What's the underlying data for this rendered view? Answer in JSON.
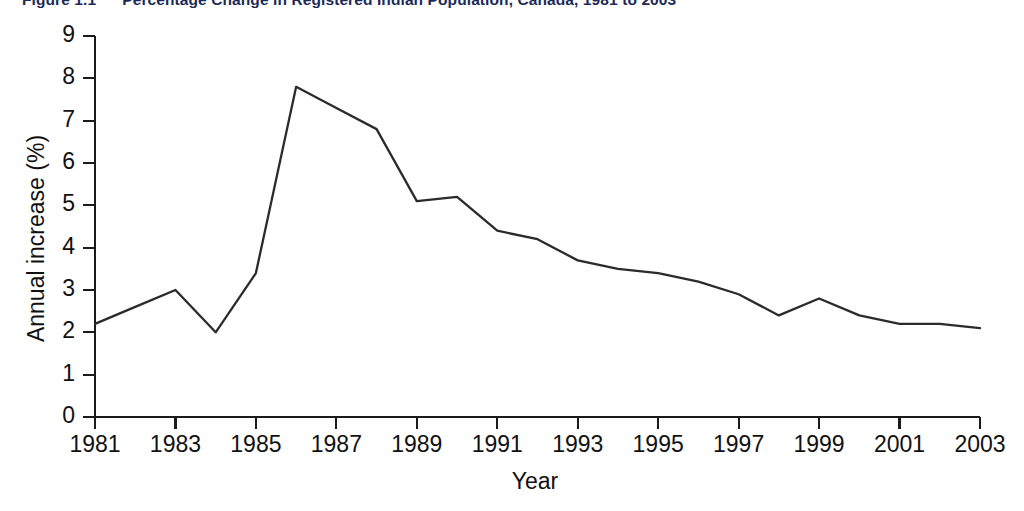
{
  "figure": {
    "title_number": "Figure 1.1",
    "title_text": "Percentage Change in Registered Indian Population, Canada, 1981 to 2003",
    "title_clipped": true
  },
  "chart_data": {
    "type": "line",
    "title": "Percentage Change in Registered Indian Population, Canada, 1981 to 2003",
    "xlabel": "Year",
    "ylabel": "Annual increase (%)",
    "xlim": [
      1981,
      2003
    ],
    "ylim": [
      0,
      9
    ],
    "grid": false,
    "legend": null,
    "line_color": "#2b2b2b",
    "x": [
      1981,
      1982,
      1983,
      1984,
      1985,
      1986,
      1987,
      1988,
      1989,
      1990,
      1991,
      1992,
      1993,
      1994,
      1995,
      1996,
      1997,
      1998,
      1999,
      2000,
      2001,
      2002,
      2003
    ],
    "values": [
      2.2,
      2.6,
      3.0,
      2.0,
      3.4,
      7.8,
      7.3,
      6.8,
      5.1,
      5.2,
      4.4,
      4.2,
      3.7,
      3.5,
      3.4,
      3.2,
      2.9,
      2.4,
      2.8,
      2.4,
      2.2,
      2.2,
      2.1
    ],
    "ytick_labels": [
      "0",
      "1",
      "2",
      "3",
      "4",
      "5",
      "6",
      "7",
      "8",
      "9"
    ],
    "ytick_values": [
      0,
      1,
      2,
      3,
      4,
      5,
      6,
      7,
      8,
      9
    ],
    "xtick_labels": [
      "1981",
      "1983",
      "1985",
      "1987",
      "1989",
      "1991",
      "1993",
      "1995",
      "1997",
      "1999",
      "2001",
      "2003"
    ],
    "xtick_values": [
      1981,
      1983,
      1985,
      1987,
      1989,
      1991,
      1993,
      1995,
      1997,
      1999,
      2001,
      2003
    ],
    "annotations": []
  }
}
